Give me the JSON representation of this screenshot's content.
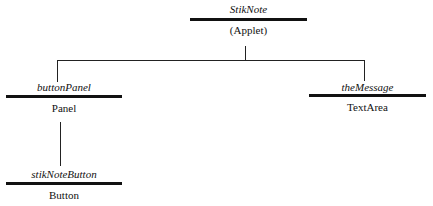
{
  "diagram": {
    "type": "component-hierarchy",
    "nodes": [
      {
        "id": "stiknote",
        "name": "StikNote",
        "type": "(Applet)"
      },
      {
        "id": "buttonpanel",
        "name": "buttonPanel",
        "type": "Panel"
      },
      {
        "id": "themessage",
        "name": "theMessage",
        "type": "TextArea"
      },
      {
        "id": "stiknotebutton",
        "name": "stikNoteButton",
        "type": "Button"
      }
    ],
    "edges": [
      {
        "from": "stiknote",
        "to": "buttonpanel"
      },
      {
        "from": "stiknote",
        "to": "themessage"
      },
      {
        "from": "buttonpanel",
        "to": "stiknotebutton"
      }
    ]
  }
}
